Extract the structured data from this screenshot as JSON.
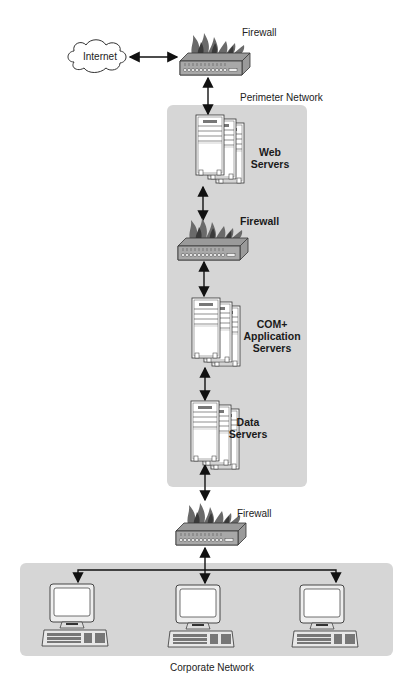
{
  "diagram": {
    "nodes": {
      "internet": {
        "label": "Internet",
        "icon": "cloud-icon"
      },
      "firewall_top": {
        "label": "Firewall",
        "icon": "firewall-icon"
      },
      "web_servers": {
        "label_line1": "Web",
        "label_line2": "Servers",
        "icon": "server-stack-icon"
      },
      "firewall_middle": {
        "label": "Firewall",
        "icon": "firewall-icon"
      },
      "app_servers": {
        "label_line1": "COM+",
        "label_line2": "Application",
        "label_line3": "Servers",
        "icon": "server-stack-icon"
      },
      "data_servers": {
        "label_line1": "Data",
        "label_line2": "Servers",
        "icon": "server-stack-icon"
      },
      "firewall_bottom": {
        "label": "Firewall",
        "icon": "firewall-icon"
      },
      "workstations": [
        {
          "icon": "desktop-computer-icon"
        },
        {
          "icon": "desktop-computer-icon"
        },
        {
          "icon": "desktop-computer-icon"
        }
      ]
    },
    "zones": {
      "perimeter": {
        "label": "Perimeter Network",
        "color": "#d6d6d6"
      },
      "corporate": {
        "label": "Corporate Network",
        "color": "#d6d6d6"
      }
    },
    "connections": [
      {
        "from": "internet",
        "to": "firewall_top",
        "type": "bidirectional"
      },
      {
        "from": "firewall_top",
        "to": "web_servers",
        "type": "bidirectional"
      },
      {
        "from": "web_servers",
        "to": "firewall_middle",
        "type": "bidirectional"
      },
      {
        "from": "firewall_middle",
        "to": "app_servers",
        "type": "bidirectional"
      },
      {
        "from": "app_servers",
        "to": "data_servers",
        "type": "bidirectional"
      },
      {
        "from": "data_servers",
        "to": "firewall_bottom",
        "type": "bidirectional"
      },
      {
        "from": "firewall_bottom",
        "to": "workstations",
        "type": "bidirectional-branch"
      }
    ]
  }
}
